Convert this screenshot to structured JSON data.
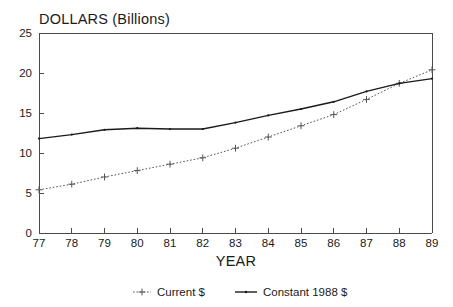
{
  "chart_data": {
    "type": "line",
    "title": "DOLLARS (Billions)",
    "xlabel": "YEAR",
    "ylabel": "",
    "x": [
      "77",
      "78",
      "79",
      "80",
      "81",
      "82",
      "83",
      "84",
      "85",
      "86",
      "87",
      "88",
      "89"
    ],
    "categories": [
      "77",
      "78",
      "79",
      "80",
      "81",
      "82",
      "83",
      "84",
      "85",
      "86",
      "87",
      "88",
      "89"
    ],
    "xlim": [
      77,
      89
    ],
    "ylim": [
      0,
      25
    ],
    "yticks": [
      "0",
      "5",
      "10",
      "15",
      "20",
      "25"
    ],
    "xticks": [
      "77",
      "78",
      "79",
      "80",
      "81",
      "82",
      "83",
      "84",
      "85",
      "86",
      "87",
      "88",
      "89"
    ],
    "grid": false,
    "legend_position": "bottom",
    "series": [
      {
        "name": "Current $",
        "style": "dotted",
        "marker": "plus",
        "color": "#555555",
        "values": [
          5.4,
          6.1,
          7.0,
          7.8,
          8.6,
          9.4,
          10.6,
          12.0,
          13.4,
          14.8,
          16.7,
          18.7,
          20.4
        ]
      },
      {
        "name": "Constant 1988 $",
        "style": "solid",
        "marker": "dot",
        "color": "#1a1a1a",
        "values": [
          11.8,
          12.3,
          12.9,
          13.1,
          13.0,
          13.0,
          13.8,
          14.7,
          15.5,
          16.4,
          17.7,
          18.7,
          19.3
        ]
      }
    ]
  },
  "legend": {
    "items": [
      {
        "label": "Current $"
      },
      {
        "label": "Constant 1988 $"
      }
    ]
  },
  "axes": {
    "y_title": "DOLLARS (Billions)",
    "x_title": "YEAR"
  }
}
